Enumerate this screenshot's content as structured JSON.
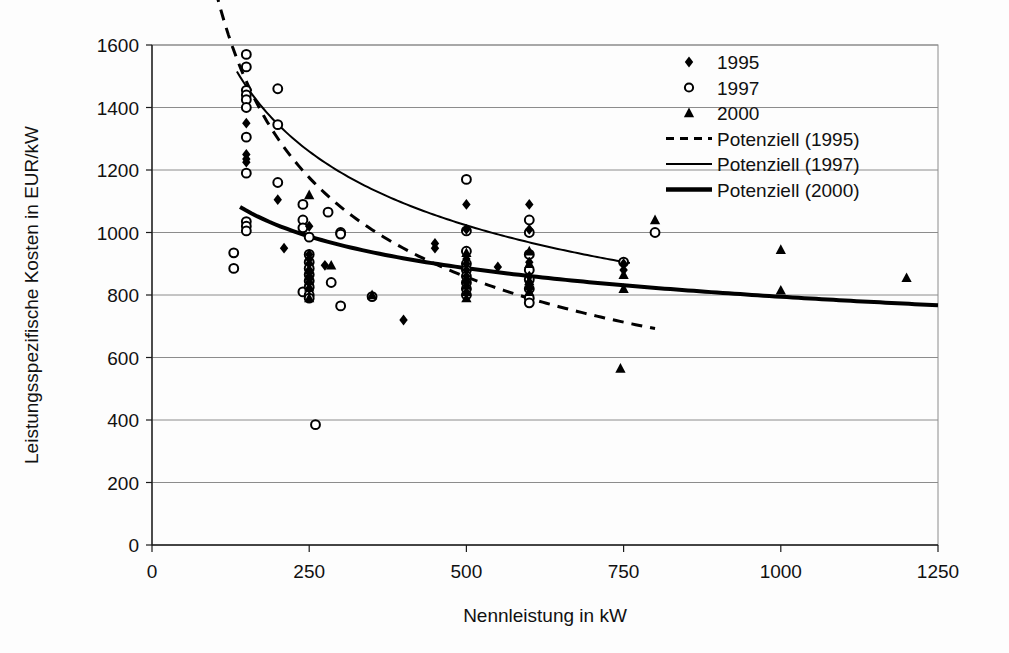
{
  "chart_data": {
    "type": "scatter",
    "title": "",
    "xlabel": "Nennleistung in kW",
    "ylabel": "Leistungsspezifische Kosten in EUR/kW",
    "xlim": [
      0,
      1250
    ],
    "ylim": [
      0,
      1600
    ],
    "xticks": [
      "0",
      "250",
      "500",
      "750",
      "1000",
      "1250"
    ],
    "xtick_values": [
      0,
      250,
      500,
      750,
      1000,
      1250
    ],
    "yticks": [
      "0",
      "200",
      "400",
      "600",
      "800",
      "1000",
      "1200",
      "1400",
      "1600"
    ],
    "ytick_values": [
      0,
      200,
      400,
      600,
      800,
      1000,
      1200,
      1400,
      1600
    ],
    "grid": true,
    "grid_axis": "y",
    "legend_position": "top-right",
    "legend": [
      {
        "label": "1995",
        "marker": "filled-diamond",
        "color": "#000000"
      },
      {
        "label": "1997",
        "marker": "open-circle",
        "color": "#000000"
      },
      {
        "label": "2000",
        "marker": "filled-triangle",
        "color": "#000000"
      },
      {
        "label": "Potenziell (1995)",
        "marker": "dashed-line",
        "color": "#000000"
      },
      {
        "label": "Potenziell (1997)",
        "marker": "thin-line",
        "color": "#000000"
      },
      {
        "label": "Potenziell (2000)",
        "marker": "thick-line",
        "color": "#000000"
      }
    ],
    "series": [
      {
        "name": "1995",
        "marker": "filled-diamond",
        "points": [
          [
            150,
            1350
          ],
          [
            150,
            1250
          ],
          [
            150,
            1235
          ],
          [
            150,
            1225
          ],
          [
            200,
            1105
          ],
          [
            210,
            950
          ],
          [
            250,
            1020
          ],
          [
            250,
            930
          ],
          [
            250,
            915
          ],
          [
            250,
            900
          ],
          [
            250,
            880
          ],
          [
            250,
            860
          ],
          [
            250,
            840
          ],
          [
            250,
            820
          ],
          [
            275,
            895
          ],
          [
            400,
            720
          ],
          [
            450,
            965
          ],
          [
            450,
            950
          ],
          [
            500,
            1090
          ],
          [
            500,
            1010
          ],
          [
            500,
            915
          ],
          [
            500,
            900
          ],
          [
            500,
            880
          ],
          [
            500,
            860
          ],
          [
            500,
            840
          ],
          [
            550,
            890
          ],
          [
            600,
            1090
          ],
          [
            600,
            1010
          ],
          [
            600,
            905
          ],
          [
            600,
            860
          ],
          [
            600,
            840
          ],
          [
            600,
            820
          ],
          [
            750,
            900
          ],
          [
            750,
            880
          ]
        ]
      },
      {
        "name": "1997",
        "marker": "open-circle",
        "points": [
          [
            150,
            1570
          ],
          [
            150,
            1530
          ],
          [
            150,
            1455
          ],
          [
            150,
            1440
          ],
          [
            150,
            1425
          ],
          [
            150,
            1400
          ],
          [
            150,
            1305
          ],
          [
            150,
            1190
          ],
          [
            150,
            1035
          ],
          [
            150,
            1020
          ],
          [
            150,
            1005
          ],
          [
            130,
            935
          ],
          [
            130,
            885
          ],
          [
            200,
            1460
          ],
          [
            200,
            1345
          ],
          [
            200,
            1160
          ],
          [
            240,
            1090
          ],
          [
            240,
            1040
          ],
          [
            240,
            1015
          ],
          [
            240,
            810
          ],
          [
            250,
            985
          ],
          [
            250,
            930
          ],
          [
            250,
            905
          ],
          [
            250,
            885
          ],
          [
            250,
            865
          ],
          [
            250,
            845
          ],
          [
            250,
            825
          ],
          [
            250,
            800
          ],
          [
            250,
            790
          ],
          [
            280,
            1065
          ],
          [
            285,
            840
          ],
          [
            260,
            385
          ],
          [
            300,
            1000
          ],
          [
            300,
            995
          ],
          [
            300,
            765
          ],
          [
            350,
            795
          ],
          [
            500,
            1170
          ],
          [
            500,
            1005
          ],
          [
            500,
            940
          ],
          [
            500,
            900
          ],
          [
            500,
            880
          ],
          [
            500,
            860
          ],
          [
            500,
            840
          ],
          [
            500,
            820
          ],
          [
            500,
            800
          ],
          [
            600,
            1040
          ],
          [
            600,
            1000
          ],
          [
            600,
            930
          ],
          [
            600,
            880
          ],
          [
            600,
            850
          ],
          [
            600,
            820
          ],
          [
            600,
            790
          ],
          [
            600,
            775
          ],
          [
            750,
            905
          ],
          [
            800,
            1000
          ]
        ]
      },
      {
        "name": "2000",
        "marker": "filled-triangle",
        "points": [
          [
            250,
            1120
          ],
          [
            250,
            880
          ],
          [
            250,
            860
          ],
          [
            250,
            845
          ],
          [
            250,
            825
          ],
          [
            250,
            790
          ],
          [
            285,
            895
          ],
          [
            350,
            800
          ],
          [
            500,
            935
          ],
          [
            500,
            850
          ],
          [
            500,
            830
          ],
          [
            500,
            810
          ],
          [
            500,
            790
          ],
          [
            600,
            940
          ],
          [
            600,
            900
          ],
          [
            600,
            845
          ],
          [
            600,
            830
          ],
          [
            600,
            810
          ],
          [
            750,
            865
          ],
          [
            750,
            820
          ],
          [
            745,
            565
          ],
          [
            800,
            1040
          ],
          [
            1000,
            945
          ],
          [
            1000,
            815
          ],
          [
            1200,
            855
          ]
        ]
      }
    ],
    "trendlines": [
      {
        "name": "Potenziell (1995)",
        "style": "dashed",
        "width": 3,
        "a": 14500,
        "b": -0.455,
        "x_start": 60,
        "x_end": 800
      },
      {
        "name": "Potenziell (1997)",
        "style": "thin-solid",
        "width": 2,
        "a": 6600,
        "b": -0.3,
        "x_start": 135,
        "x_end": 760
      },
      {
        "name": "Potenziell (2000)",
        "style": "thick-solid",
        "width": 4,
        "a": 2350,
        "b": -0.157,
        "x_start": 140,
        "x_end": 1250
      }
    ]
  }
}
